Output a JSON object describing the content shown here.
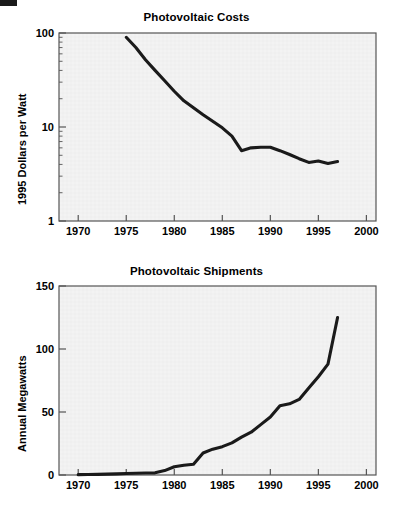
{
  "page": {
    "background_color": "#ffffff",
    "plot_background_color": "#f3f3f3",
    "line_color": "#1a1a1a",
    "axis_color": "#555555"
  },
  "artifact": {
    "label": "scan-edge-artifact"
  },
  "chart_data": [
    {
      "type": "line",
      "id": "photovoltaic-costs",
      "title": "Photovoltaic Costs",
      "xlabel": "",
      "ylabel": "1995 Dollars per Watt",
      "yscale": "log",
      "xlim": [
        1968,
        2001
      ],
      "ylim": [
        1,
        100
      ],
      "grid": false,
      "xticks": [
        1970,
        1975,
        1980,
        1985,
        1990,
        1995,
        2000
      ],
      "xtick_labels": [
        "1970",
        "1975",
        "1980",
        "1985",
        "1990",
        "1995",
        "2000"
      ],
      "yticks": [
        1,
        10,
        100
      ],
      "ytick_labels": [
        "1",
        "10",
        "100"
      ],
      "x": [
        1975,
        1976,
        1977,
        1978,
        1979,
        1980,
        1981,
        1982,
        1983,
        1984,
        1985,
        1986,
        1987,
        1988,
        1989,
        1990,
        1991,
        1992,
        1993,
        1994,
        1995,
        1996,
        1997
      ],
      "values": [
        90,
        70,
        52,
        40,
        31,
        24,
        19,
        16,
        13.5,
        11.5,
        9.8,
        8.0,
        5.6,
        6.0,
        6.1,
        6.1,
        5.6,
        5.1,
        4.6,
        4.2,
        4.35,
        4.1,
        4.3
      ]
    },
    {
      "type": "line",
      "id": "photovoltaic-shipments",
      "title": "Photovoltaic Shipments",
      "xlabel": "",
      "ylabel": "Annual Megawatts",
      "yscale": "linear",
      "xlim": [
        1968,
        2001
      ],
      "ylim": [
        0,
        150
      ],
      "grid": false,
      "xticks": [
        1970,
        1975,
        1980,
        1985,
        1990,
        1995,
        2000
      ],
      "xtick_labels": [
        "1970",
        "1975",
        "1980",
        "1985",
        "1990",
        "1995",
        "2000"
      ],
      "yticks": [
        0,
        50,
        100,
        150
      ],
      "ytick_labels": [
        "0",
        "50",
        "100",
        "150"
      ],
      "x": [
        1970,
        1971,
        1972,
        1973,
        1974,
        1975,
        1976,
        1977,
        1978,
        1979,
        1980,
        1981,
        1982,
        1983,
        1984,
        1985,
        1986,
        1987,
        1988,
        1989,
        1990,
        1991,
        1992,
        1993,
        1994,
        1995,
        1996,
        1997
      ],
      "values": [
        0.3,
        0.4,
        0.5,
        0.7,
        0.9,
        1.2,
        1.4,
        1.6,
        1.7,
        3.5,
        6.5,
        7.8,
        8.5,
        17.5,
        20.5,
        22.5,
        25.5,
        30,
        34,
        40,
        46,
        55,
        56.5,
        60,
        69,
        78,
        88,
        125
      ]
    }
  ]
}
